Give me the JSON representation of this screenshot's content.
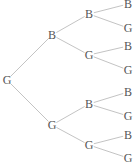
{
  "diagram": {
    "type": "probability-tree",
    "nodes": [
      {
        "id": "root",
        "label": "G",
        "x": 7,
        "y": 80
      },
      {
        "id": "b1",
        "label": "B",
        "x": 52,
        "y": 35
      },
      {
        "id": "g1",
        "label": "G",
        "x": 52,
        "y": 125
      },
      {
        "id": "b1b2",
        "label": "B",
        "x": 89,
        "y": 14
      },
      {
        "id": "b1g2",
        "label": "G",
        "x": 89,
        "y": 55
      },
      {
        "id": "g1b2",
        "label": "B",
        "x": 89,
        "y": 104
      },
      {
        "id": "g1g2",
        "label": "G",
        "x": 89,
        "y": 145
      },
      {
        "id": "b1b2b3",
        "label": "B",
        "x": 128,
        "y": 4
      },
      {
        "id": "b1b2g3",
        "label": "G",
        "x": 128,
        "y": 28
      },
      {
        "id": "b1g2b3",
        "label": "B",
        "x": 128,
        "y": 46
      },
      {
        "id": "b1g2g3",
        "label": "G",
        "x": 128,
        "y": 70
      },
      {
        "id": "g1b2b3",
        "label": "B",
        "x": 128,
        "y": 92
      },
      {
        "id": "g1b2g3",
        "label": "G",
        "x": 128,
        "y": 116
      },
      {
        "id": "g1g2b3",
        "label": "B",
        "x": 128,
        "y": 135
      },
      {
        "id": "g1g2g3",
        "label": "G",
        "x": 128,
        "y": 158
      }
    ],
    "edges": [
      [
        "root",
        "b1"
      ],
      [
        "root",
        "g1"
      ],
      [
        "b1",
        "b1b2"
      ],
      [
        "b1",
        "b1g2"
      ],
      [
        "g1",
        "g1b2"
      ],
      [
        "g1",
        "g1g2"
      ],
      [
        "b1b2",
        "b1b2b3"
      ],
      [
        "b1b2",
        "b1b2g3"
      ],
      [
        "b1g2",
        "b1g2b3"
      ],
      [
        "b1g2",
        "b1g2g3"
      ],
      [
        "g1b2",
        "g1b2b3"
      ],
      [
        "g1b2",
        "g1b2g3"
      ],
      [
        "g1g2",
        "g1g2b3"
      ],
      [
        "g1g2",
        "g1g2g3"
      ]
    ],
    "colors": {
      "edge": "#b4b4b4",
      "text": "#555555"
    }
  }
}
